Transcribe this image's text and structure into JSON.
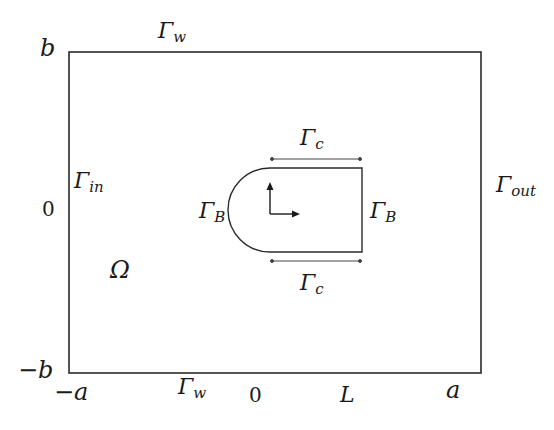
{
  "diagram": {
    "region_label": "Ω",
    "boundaries": {
      "top": {
        "main": "Γ",
        "sub": "w"
      },
      "bottom": {
        "main": "Γ",
        "sub": "w"
      },
      "left": {
        "main": "Γ",
        "sub": "in"
      },
      "right": {
        "main": "Γ",
        "sub": "out"
      },
      "body_left": {
        "main": "Γ",
        "sub": "B"
      },
      "body_right": {
        "main": "Γ",
        "sub": "B"
      },
      "body_top": {
        "main": "Γ",
        "sub": "c"
      },
      "body_bottom": {
        "main": "Γ",
        "sub": "c"
      }
    },
    "y_ticks": {
      "top": "b",
      "middle": "0",
      "bottom": "−b"
    },
    "x_ticks": {
      "left": "−a",
      "origin": "0",
      "body_end": "L",
      "right": "a"
    },
    "colors": {
      "line": "#2a2a2a",
      "text": "#1a1a1a",
      "background": "#ffffff"
    }
  }
}
